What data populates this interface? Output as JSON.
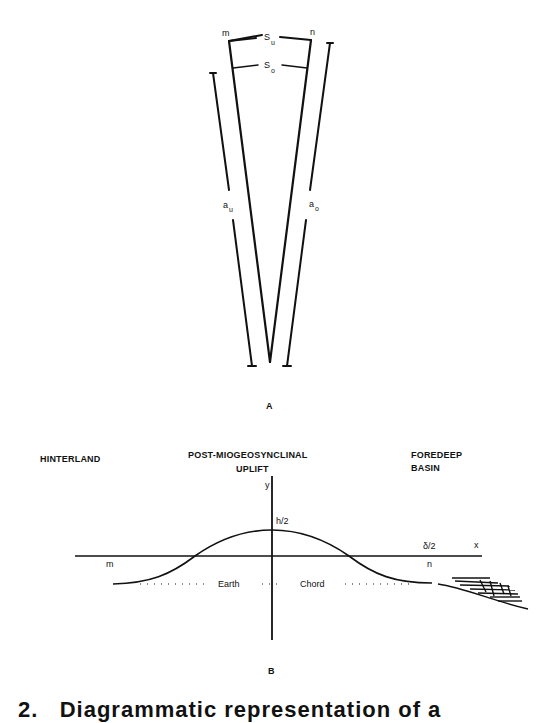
{
  "panel_a": {
    "label": "A",
    "point_left": "m",
    "point_right": "n",
    "arc_upper": "S",
    "arc_upper_sub": "u",
    "arc_lower": "S",
    "arc_lower_sub": "o",
    "side_left": "a",
    "side_left_sub": "u",
    "side_right": "a",
    "side_right_sub": "o"
  },
  "panel_b": {
    "label": "B",
    "region_left": "HINTERLAND",
    "region_center_line1": "POST-MIOGEOSYNCLINAL",
    "region_center_line2": "UPLIFT",
    "region_right_line1": "FOREDEEP",
    "region_right_line2": "BASIN",
    "axis_y": "y",
    "axis_x": "x",
    "peak_label": "h/2",
    "right_tick_label": "δ/2",
    "point_left": "m",
    "point_right": "n",
    "chord_left": "Earth",
    "chord_right": "Chord"
  },
  "caption": {
    "text": "2.   Diagrammatic representation of a"
  }
}
